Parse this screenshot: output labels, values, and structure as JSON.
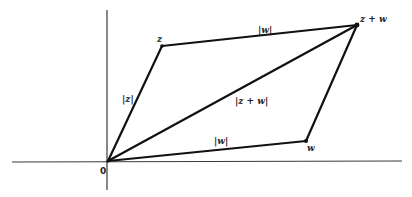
{
  "diagram": {
    "type": "parallelogram-vector-addition",
    "axes": {
      "horizontal": {
        "x1": 12,
        "y1": 162,
        "x2": 402,
        "y2": 161
      },
      "vertical": {
        "x1": 107,
        "y1": 10,
        "x2": 107,
        "y2": 190
      }
    },
    "points": {
      "origin": {
        "label": "0",
        "x": 108,
        "y": 161
      },
      "z": {
        "label": "z",
        "x": 162,
        "y": 46
      },
      "z_plus_w": {
        "label": "z + w",
        "x": 357,
        "y": 25
      },
      "w": {
        "label": "w",
        "x": 306,
        "y": 141
      }
    },
    "edge_labels": {
      "abs_z": "|z|",
      "abs_w_top": "|w|",
      "abs_w_bottom": "|w|",
      "abs_z_plus_w": "|z + w|"
    }
  }
}
